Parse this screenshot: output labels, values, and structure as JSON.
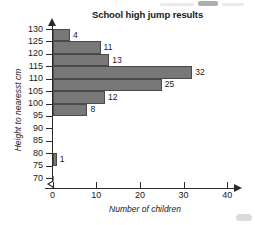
{
  "chart_data": {
    "type": "bar",
    "orientation": "horizontal",
    "title": "School high jump results",
    "xlabel": "Number of children",
    "ylabel": "Height to nearesst cm",
    "xlim": [
      0,
      40
    ],
    "ylim": [
      70,
      130
    ],
    "xticks": [
      "0",
      "10",
      "20",
      "30",
      "40"
    ],
    "yticks": [
      "130",
      "125",
      "120",
      "115",
      "110",
      "105",
      "100",
      "95",
      "90",
      "85",
      "80",
      "75",
      "70"
    ],
    "grid": false,
    "legend": null,
    "bar_color": "#787878",
    "bar_edge_color": "#4a4a4a",
    "axis_color": "#2b2b2b",
    "bins": [
      {
        "label": "75-80",
        "lower": 75,
        "upper": 80,
        "value": 1
      },
      {
        "label": "95-100",
        "lower": 95,
        "upper": 100,
        "value": 8
      },
      {
        "label": "100-105",
        "lower": 100,
        "upper": 105,
        "value": 12
      },
      {
        "label": "105-110",
        "lower": 105,
        "upper": 110,
        "value": 25
      },
      {
        "label": "110-115",
        "lower": 110,
        "upper": 115,
        "value": 32
      },
      {
        "label": "115-120",
        "lower": 115,
        "upper": 120,
        "value": 13
      },
      {
        "label": "120-125",
        "lower": 120,
        "upper": 125,
        "value": 11
      },
      {
        "label": "125-130",
        "lower": 125,
        "upper": 130,
        "value": 4
      }
    ],
    "categories": [
      "75-80",
      "95-100",
      "100-105",
      "105-110",
      "110-115",
      "115-120",
      "120-125",
      "125-130"
    ],
    "values": [
      1,
      8,
      12,
      25,
      32,
      13,
      11,
      4
    ]
  }
}
